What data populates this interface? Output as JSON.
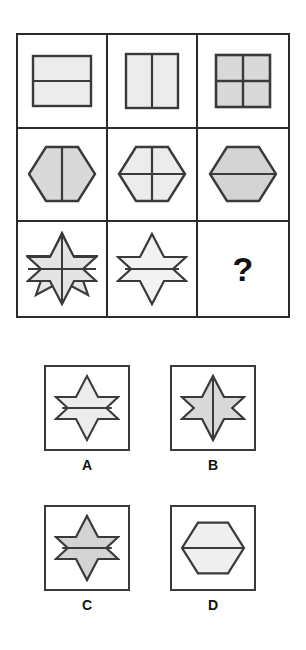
{
  "puzzle": {
    "type": "visual-analogy-matrix",
    "question_mark": "?",
    "colors": {
      "stroke": "#3a3a3a",
      "fill_light": "#ececec",
      "fill_mid": "#d9d9d9",
      "grid_line": "#2b2b2b",
      "background": "#ffffff",
      "text": "#111111"
    },
    "matrix": {
      "rows": 3,
      "cols": 3,
      "cells": [
        {
          "id": "r1c1",
          "shape": "square",
          "divider": "horizontal",
          "fill": "light",
          "label": "square split by horizontal line"
        },
        {
          "id": "r1c2",
          "shape": "square",
          "divider": "vertical",
          "fill": "light",
          "label": "square split by vertical line"
        },
        {
          "id": "r1c3",
          "shape": "square",
          "divider": "cross",
          "fill": "light",
          "label": "square split by cross"
        },
        {
          "id": "r2c1",
          "shape": "hexagon",
          "divider": "vertical",
          "fill": "mid",
          "label": "hexagon split by vertical line"
        },
        {
          "id": "r2c2",
          "shape": "hexagon",
          "divider": "cross",
          "fill": "light",
          "label": "hexagon split by cross"
        },
        {
          "id": "r2c3",
          "shape": "hexagon",
          "divider": "horizontal",
          "fill": "mid",
          "label": "hexagon split by horizontal line"
        },
        {
          "id": "r3c1",
          "shape": "star6",
          "divider": "cross",
          "fill": "light",
          "label": "six-pointed star split by cross"
        },
        {
          "id": "r3c2",
          "shape": "star6",
          "divider": "horizontal",
          "fill": "light",
          "label": "six-pointed star split by horizontal line"
        },
        {
          "id": "r3c3",
          "shape": "question",
          "divider": "none",
          "fill": "none",
          "label": "missing tile"
        }
      ]
    },
    "options": [
      {
        "key": "A",
        "shape": "star6",
        "divider": "horizontal",
        "fill": "light",
        "label": "A"
      },
      {
        "key": "B",
        "shape": "star6",
        "divider": "vertical",
        "fill": "mid",
        "label": "B"
      },
      {
        "key": "C",
        "shape": "star6",
        "divider": "horizontal",
        "fill": "mid",
        "label": "C"
      },
      {
        "key": "D",
        "shape": "hexagon",
        "divider": "horizontal",
        "fill": "light",
        "label": "D"
      }
    ]
  }
}
